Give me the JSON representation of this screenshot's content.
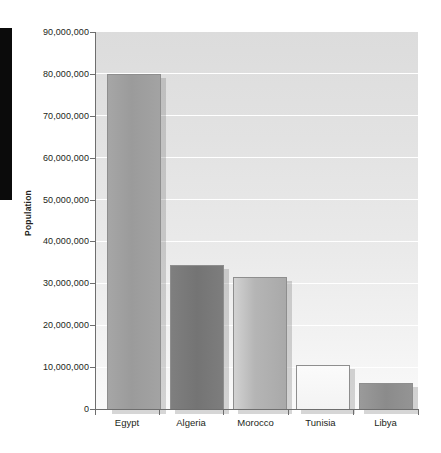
{
  "chart_data": {
    "type": "bar",
    "title": "",
    "xlabel": "",
    "ylabel": "Population",
    "categories": [
      "Egypt",
      "Algeria",
      "Morocco",
      "Tunisia",
      "Libya"
    ],
    "values": [
      80000000,
      34300000,
      31500000,
      10500000,
      6200000
    ],
    "ylim": [
      0,
      90000000
    ],
    "y_tick_values": [
      0,
      10000000,
      20000000,
      30000000,
      40000000,
      50000000,
      60000000,
      70000000,
      80000000,
      90000000
    ],
    "y_tick_labels": [
      "0",
      "10,000,000",
      "20,000,000",
      "30,000,000",
      "40,000,000",
      "50,000,000",
      "60,000,000",
      "70,000,000",
      "80,000,000",
      "90,000,000"
    ],
    "grid": true,
    "grid_color": "#ffffff",
    "legend": false,
    "plot_background": "#e4e4e4",
    "bar_border_color": "#8e8e8e",
    "bar_colors": [
      "#9e9e9e",
      "#7b7b7b",
      "#b3b3b3",
      "#f4f4f4",
      "#8f8f8f"
    ],
    "series": [
      {
        "name": "Population",
        "values": [
          80000000,
          34300000,
          31500000,
          10500000,
          6200000
        ]
      }
    ]
  },
  "axes": {
    "y_title": "Population",
    "y_labels": {
      "t90": "90,000,000",
      "t80": "80,000,000",
      "t70": "70,000,000",
      "t60": "60,000,000",
      "t50": "50,000,000",
      "t40": "40,000,000",
      "t30": "30,000,000",
      "t20": "20,000,000",
      "t10": "10,000,000",
      "t0": "0"
    },
    "x_labels": {
      "c0": "Egypt",
      "c1": "Algeria",
      "c2": "Morocco",
      "c3": "Tunisia",
      "c4": "Libya"
    }
  }
}
